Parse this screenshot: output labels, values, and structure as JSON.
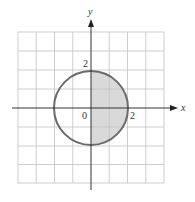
{
  "figure": {
    "type": "region-on-coordinate-grid",
    "axes": {
      "x_label": "x",
      "y_label": "y",
      "origin_label": "0",
      "x_tick_label": "2",
      "y_tick_label": "2"
    },
    "grid": {
      "x_range": [
        -4,
        4
      ],
      "y_range": [
        -4,
        4
      ],
      "cells": 8
    },
    "circle": {
      "center": [
        0,
        0
      ],
      "radius": 2,
      "stroke_color": "#6b6b6b"
    },
    "shaded_region": {
      "description": "right half-disk, x >= 0",
      "fill_color": "#d9d9d9"
    },
    "colors": {
      "grid": "#c8c8c8",
      "axes": "#333333"
    }
  }
}
